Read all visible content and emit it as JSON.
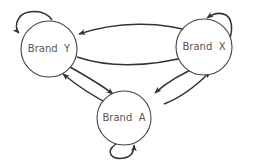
{
  "diagram": {
    "type": "state-transition",
    "nodes": [
      {
        "id": "Y",
        "label": "Brand  Y",
        "cx": 49,
        "cy": 49,
        "r": 28
      },
      {
        "id": "X",
        "label": "Brand  X",
        "cx": 204,
        "cy": 47,
        "r": 28
      },
      {
        "id": "A",
        "label": "Brand  A",
        "cx": 124,
        "cy": 118,
        "r": 27
      }
    ],
    "edges": [
      {
        "from": "Y",
        "to": "Y",
        "kind": "self-loop"
      },
      {
        "from": "X",
        "to": "X",
        "kind": "self-loop"
      },
      {
        "from": "A",
        "to": "A",
        "kind": "self-loop"
      },
      {
        "from": "X",
        "to": "Y"
      },
      {
        "from": "Y",
        "to": "X"
      },
      {
        "from": "Y",
        "to": "A"
      },
      {
        "from": "A",
        "to": "Y"
      },
      {
        "from": "X",
        "to": "A"
      },
      {
        "from": "A",
        "to": "X"
      }
    ],
    "colors": {
      "stroke": "#333333",
      "node_stroke": "#444444",
      "text": "#555555",
      "background": "#ffffff"
    }
  }
}
